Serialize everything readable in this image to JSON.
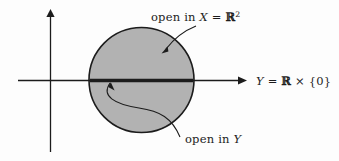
{
  "figure": {
    "background_color": "#fdfdfd",
    "ink_color": "#1c1c1c",
    "disk_fill_color": "#b2b2b2",
    "disk_stroke_color": "#1c1c1c"
  },
  "axes": {
    "horizontal_axis_name": "horizontal-axis",
    "vertical_axis_name": "vertical-axis",
    "origin": {
      "x": 50,
      "y": 81
    }
  },
  "labels": {
    "open_in_x": {
      "text_prefix": "open in ",
      "variable": "X",
      "equals": " = ",
      "set": "R",
      "exponent": "2",
      "full_text": "open in X = ℝ²"
    },
    "open_in_y": {
      "text_prefix": "open in ",
      "variable": "Y",
      "full_text": "open in Y"
    },
    "y_axis_set": {
      "variable": "Y",
      "equals": " = ",
      "set": "R",
      "times": " × ",
      "singleton": "{0}",
      "full_text": "Y = ℝ × {0}"
    }
  },
  "shapes": {
    "disk": {
      "name": "shaded-disk",
      "center_x": 141.5,
      "center_y": 80,
      "radius": 52.5
    },
    "thick_segment": {
      "name": "open-in-y-segment",
      "x1": 90,
      "x2": 193,
      "y": 80.5
    }
  }
}
